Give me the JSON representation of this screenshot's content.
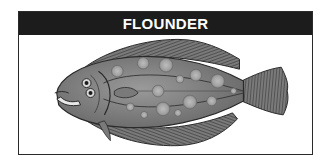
{
  "header": {
    "title": "FLOUNDER"
  },
  "illustration": {
    "subject": "flounder-fish",
    "colors": {
      "header_bg": "#1c1c1c",
      "header_text": "#ffffff",
      "body": "#8a8a8a",
      "fin": "#6e6e6e",
      "spot": "#a8a8a8",
      "outline": "#2a2a2a"
    }
  }
}
